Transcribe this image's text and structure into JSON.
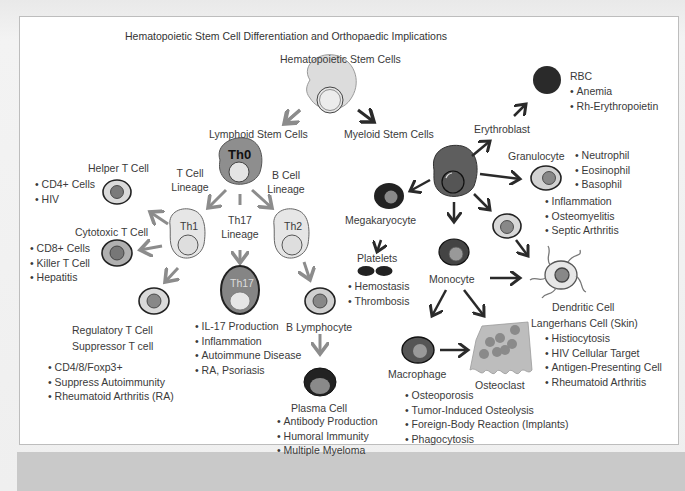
{
  "title": "Hematopoietic Stem Cell Differentiation and Orthopaedic Implications",
  "root": {
    "label": "Hematopoietic Stem Cells"
  },
  "lymphoid": {
    "label": "Lymphoid Stem Cells",
    "th0": "Th0",
    "t_lineage": [
      "T Cell",
      "Lineage"
    ],
    "b_lineage": [
      "B Cell",
      "Lineage"
    ],
    "th17_lineage": [
      "Th17",
      "Lineage"
    ],
    "th1": "Th1",
    "th2": "Th2",
    "th17": "Th17",
    "helper": {
      "label": "Helper T Cell",
      "items": [
        "CD4+ Cells",
        "HIV"
      ]
    },
    "cytotoxic": {
      "label": "Cytotoxic T Cell",
      "items": [
        "CD8+ Cells",
        "Killer T Cell",
        "Hepatitis"
      ]
    },
    "regulatory": {
      "label": "Regulatory T Cell",
      "label2": "Suppressor T cell",
      "items": [
        "CD4/8/Foxp3+",
        "Suppress Autoimmunity",
        "Rheumatoid Arthritis (RA)"
      ]
    },
    "th17_items": [
      "IL-17 Production",
      "Inflammation",
      "Autoimmune Disease",
      "RA, Psoriasis"
    ],
    "b_lymphocyte": {
      "label": "B Lymphocyte"
    },
    "plasma": {
      "label": "Plasma Cell",
      "items": [
        "Antibody Production",
        "Humoral Immunity",
        "Multiple Myeloma"
      ]
    }
  },
  "myeloid": {
    "label": "Myeloid Stem Cells",
    "erythroblast": {
      "label": "Erythroblast"
    },
    "rbc": {
      "label": "RBC",
      "items": [
        "Anemia",
        "Rh-Erythropoietin"
      ]
    },
    "granulocyte": {
      "label": "Granulocyte",
      "types": [
        "Neutrophil",
        "Eosinophil",
        "Basophil"
      ],
      "items": [
        "Inflammation",
        "Osteomyelitis",
        "Septic Arthritis"
      ]
    },
    "megakaryocyte": {
      "label": "Megakaryocyte"
    },
    "platelets": {
      "label": "Platelets",
      "items": [
        "Hemostasis",
        "Thrombosis"
      ]
    },
    "monocyte": {
      "label": "Monocyte"
    },
    "dendritic": {
      "label": "Dendritic Cell",
      "label2": "Langerhans Cell (Skin)",
      "items": [
        "Histiocytosis",
        "HIV Cellular Target",
        "Antigen-Presenting Cell",
        "Rheumatoid Arthritis"
      ]
    },
    "macrophage": {
      "label": "Macrophage"
    },
    "osteoclast": {
      "label": "Osteoclast",
      "items": [
        "Osteoporosis",
        "Tumor-Induced Osteolysis",
        "Foreign-Body Reaction (Implants)",
        "Phagocytosis"
      ]
    }
  },
  "colors": {
    "light_cell": "#e2e2e2",
    "mid_cell": "#8a8a8a",
    "dark_cell": "#2b2b2b",
    "lymphoid_arrow": "#8c8c8c",
    "myeloid_arrow": "#2a2a2a"
  }
}
